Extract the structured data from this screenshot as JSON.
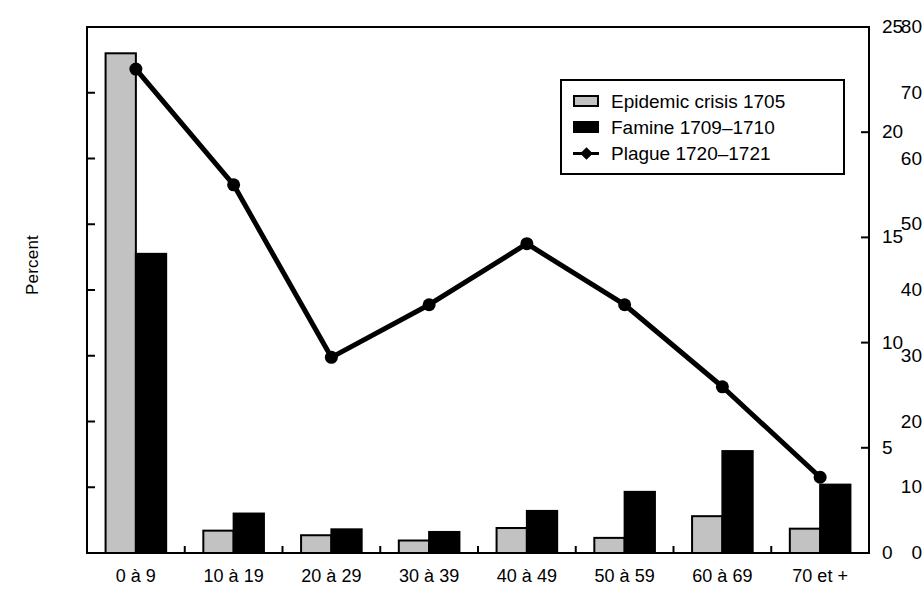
{
  "chart_data": {
    "type": "bar",
    "title": "",
    "xlabel": "",
    "ylabel": "Percent",
    "y2label": "",
    "categories": [
      "0 à 9",
      "10 à 19",
      "20 à 29",
      "30 à 39",
      "40 à 49",
      "50 à 59",
      "60 à 69",
      "70 et +"
    ],
    "ylim": [
      0,
      80
    ],
    "y2lim": [
      0,
      25
    ],
    "yticks": [
      0,
      10,
      20,
      30,
      40,
      50,
      60,
      70,
      80
    ],
    "y2ticks": [
      0,
      5,
      10,
      15,
      20,
      25
    ],
    "grid": false,
    "legend_position": "upper right",
    "series": [
      {
        "name": "Epidemic crisis 1705",
        "kind": "bar",
        "axis": "left",
        "color": "#c2c2c2",
        "edge_color": "#000000",
        "values": [
          76.0,
          3.4,
          2.7,
          1.9,
          3.8,
          2.3,
          5.6,
          3.7
        ]
      },
      {
        "name": "Famine 1709–1710",
        "kind": "bar",
        "axis": "left",
        "color": "#000000",
        "edge_color": "#000000",
        "values": [
          45.5,
          6.0,
          3.6,
          3.2,
          6.4,
          9.3,
          15.5,
          10.4
        ]
      },
      {
        "name": "Plague 1720–1721",
        "kind": "line",
        "axis": "right",
        "color": "#000000",
        "marker": "circle",
        "values": [
          23.0,
          17.5,
          9.3,
          11.8,
          14.7,
          11.8,
          7.9,
          3.6
        ]
      }
    ]
  },
  "axes": {
    "left_ticks": [
      "0",
      "10",
      "20",
      "30",
      "40",
      "50",
      "60",
      "70",
      "80"
    ],
    "right_ticks": [
      "0",
      "5",
      "10",
      "15",
      "20",
      "25"
    ],
    "y_title": "Percent"
  },
  "legend": {
    "items": [
      {
        "label": "Epidemic crisis 1705",
        "swatch": "gray-bar-swatch"
      },
      {
        "label": "Famine 1709–1710",
        "swatch": "black-bar-swatch"
      },
      {
        "label": "Plague 1720–1721",
        "swatch": "line-marker-swatch"
      }
    ]
  }
}
